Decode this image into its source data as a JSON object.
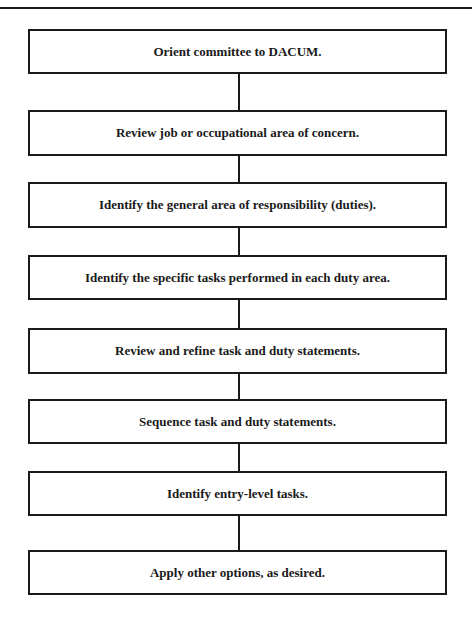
{
  "flowchart": {
    "steps": [
      {
        "label": "Orient committee to DACUM."
      },
      {
        "label": "Review job or occupational area of concern."
      },
      {
        "label": "Identify the general area of responsibility (duties)."
      },
      {
        "label": "Identify the specific tasks performed in each duty area."
      },
      {
        "label": "Review and refine task and duty statements."
      },
      {
        "label": "Sequence task and duty statements."
      },
      {
        "label": "Identify entry-level tasks."
      },
      {
        "label": "Apply other options, as desired."
      }
    ]
  },
  "colors": {
    "line": "#1a1a1a",
    "background": "#ffffff"
  }
}
